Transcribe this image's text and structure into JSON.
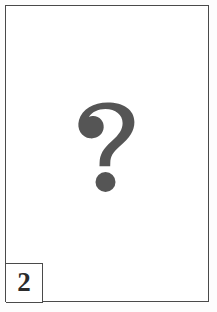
{
  "page": {
    "type": "scanned-plate",
    "background_color": "#fdfdfd",
    "frame_color": "#4a4a4a",
    "field_color": "#ffffff"
  },
  "plate": {
    "missing_image_placeholder": {
      "icon": "question-mark-icon",
      "symbol": "?",
      "color": "#555555",
      "description": "Large gray question mark indicating a missing or unavailable illustration"
    },
    "number_box": {
      "label": "2",
      "border_color": "#4a4a4a",
      "text_color": "#2b2b2b"
    }
  }
}
